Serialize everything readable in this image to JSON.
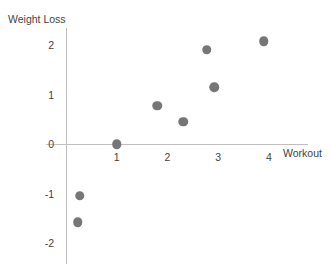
{
  "chart_data": {
    "type": "scatter",
    "title": "",
    "xlabel": "Workout",
    "ylabel": "Weight Loss",
    "xlim": [
      -0.4,
      4.8
    ],
    "ylim": [
      -2.35,
      2.35
    ],
    "grid": false,
    "legend": "none",
    "marker_color": "#767676",
    "axis_color": "#bfbfbf",
    "x_ticks": [
      "1",
      "2",
      "3",
      "4"
    ],
    "x_tick_values": [
      1,
      2,
      3,
      4
    ],
    "y_ticks": [
      "2",
      "1",
      "0",
      "-1",
      "-2"
    ],
    "y_tick_values": [
      2,
      1,
      0,
      -1,
      -2
    ],
    "points": [
      {
        "x": 0.27,
        "y": -1.05
      },
      {
        "x": 0.23,
        "y": -1.58
      },
      {
        "x": 1.0,
        "y": 0.0
      },
      {
        "x": 1.8,
        "y": 0.77
      },
      {
        "x": 2.31,
        "y": 0.45
      },
      {
        "x": 2.78,
        "y": 1.9
      },
      {
        "x": 2.92,
        "y": 1.15
      },
      {
        "x": 3.9,
        "y": 2.08
      }
    ]
  },
  "axes": {
    "y_title": "Weight Loss",
    "x_title": "Workout"
  }
}
